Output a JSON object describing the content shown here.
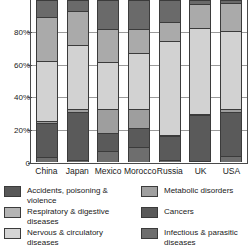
{
  "chart_data": {
    "type": "bar",
    "subtype": "stacked-percentage",
    "title": "",
    "xlabel": "",
    "ylabel": "",
    "ylim": [
      0,
      100
    ],
    "yticks": [
      "0",
      "20%",
      "40%",
      "60%",
      "80%"
    ],
    "ytick_values": [
      0,
      20,
      40,
      60,
      80
    ],
    "grid": true,
    "legend_position": "bottom",
    "note": "Top of plot is cropped; bars extend above the visible top edge of the image.",
    "categories": [
      "China",
      "Japan",
      "Mexico",
      "Morocco",
      "Russia",
      "UK",
      "USA"
    ],
    "series": [
      {
        "name": "Infectious & parasitic diseases",
        "color": "#6e6e6e",
        "values": [
          3,
          1.5,
          7,
          9,
          1,
          0.5,
          4
        ]
      },
      {
        "name": "Cancers",
        "color": "#5a5a5a",
        "values": [
          21,
          29.5,
          11,
          12,
          15,
          28.5,
          27
        ]
      },
      {
        "name": "Metabolic disorders",
        "color": "#9e9e9e",
        "values": [
          1.5,
          2,
          15,
          12,
          0.5,
          0.5,
          2
        ]
      },
      {
        "name": "Nervous & circulatory diseases",
        "color": "#d2d2d2",
        "values": [
          37,
          39,
          29,
          34,
          58,
          53,
          48
        ]
      },
      {
        "name": "Respiratory & digestive diseases",
        "color": "#aaaaaa",
        "values": [
          27,
          21,
          20,
          15,
          12,
          15,
          17
        ]
      },
      {
        "name": "Accidents, poisoning & violence",
        "color": "#6a6a6a",
        "values": [
          10.5,
          7,
          18,
          18,
          13.5,
          2.5,
          2
        ]
      }
    ]
  },
  "legend": {
    "left_column": [
      {
        "label": "Accidents, poisoning & violence",
        "color": "#585858",
        "icon": "legend-swatch"
      },
      {
        "label": "Respiratory & digestive diseases",
        "color": "#b4b4b4",
        "icon": "legend-swatch"
      },
      {
        "label": "Nervous & circulatory diseases",
        "color": "#d4d4d4",
        "icon": "legend-swatch"
      }
    ],
    "right_column": [
      {
        "label": "Metabolic disorders",
        "color": "#a0a0a0",
        "icon": "legend-swatch"
      },
      {
        "label": "Cancers",
        "color": "#5a5a5a",
        "icon": "legend-swatch"
      },
      {
        "label": "Infectious & parasitic\ndiseases",
        "color": "#6e6e6e",
        "icon": "legend-swatch"
      }
    ]
  },
  "colors": {
    "axis": "#4a4a4a",
    "grid": "#9a9a9a",
    "background": "#ffffff",
    "text": "#1a1a1a"
  }
}
